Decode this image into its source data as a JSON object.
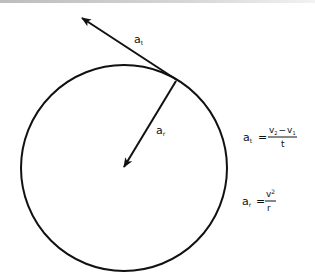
{
  "diagram": {
    "labels": {
      "tangential_vector": "a",
      "tangential_sub": "t",
      "radial_vector": "a",
      "radial_sub": "r"
    },
    "formulas": {
      "tangential": {
        "lhs": "a",
        "lhs_sub": "t",
        "equals": "=",
        "num_a": "v",
        "num_a_sub": "2",
        "minus": "−",
        "num_b": "v",
        "num_b_sub": "1",
        "den": "t"
      },
      "radial": {
        "lhs": "a",
        "lhs_sub": "r",
        "equals": "=",
        "num": "v",
        "num_sup": "2",
        "den": "r"
      }
    },
    "colors": {
      "stroke": "#111111",
      "background": "#ffffff"
    }
  }
}
